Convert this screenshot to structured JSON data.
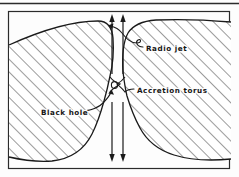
{
  "figure": {
    "title_rule": true,
    "frame": {
      "x": 8,
      "y": 11,
      "width": 222,
      "height": 158,
      "stroke": "#2b2b2b"
    },
    "background": "#fdfdfd",
    "ink": "#1a1a1a",
    "hatch": {
      "angle_deg": 45,
      "spacing_px": 9,
      "stroke": "#3a3a3a"
    },
    "labels": [
      {
        "id": "radio-jet",
        "text": "Radio jet",
        "x": 146,
        "y": 48
      },
      {
        "id": "accretion-torus",
        "text": "Accretion torus",
        "x": 137,
        "y": 91
      },
      {
        "id": "black-hole",
        "text": "Black hole",
        "x": 41,
        "y": 118
      }
    ],
    "jet": {
      "channel_left_x": 111,
      "channel_right_x": 123,
      "up_arrows": 2,
      "down_arrows": 2
    }
  }
}
